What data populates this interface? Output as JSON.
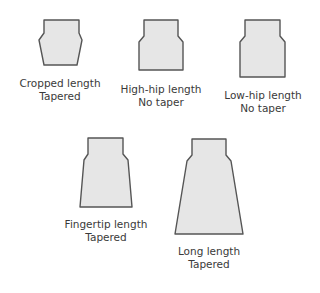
{
  "diagram": {
    "colors": {
      "fill": "#e6e6e6",
      "stroke": "#555555",
      "text": "#3a3a3a"
    },
    "shapes": [
      {
        "id": "cropped",
        "line1": "Cropped length",
        "line2": "Tapered",
        "points": "44,20 79,20 79,33 82,40 77,65 44,65 39,40 44,33"
      },
      {
        "id": "high-hip",
        "line1": "High-hip length",
        "line2": "No taper",
        "points": "144,20 178,20 178,36 183,42 183,70 139,70 139,42 144,36"
      },
      {
        "id": "low-hip",
        "line1": "Low-hip length",
        "line2": "No taper",
        "points": "245,20 280,20 280,36 285,42 285,77 240,77 240,42 245,36"
      },
      {
        "id": "fingertip",
        "line1": "Fingertip length",
        "line2": "Tapered",
        "points": "88,138 123,138 123,154 128,160 132,207 80,207 84,160 88,154"
      },
      {
        "id": "long",
        "line1": "Long length",
        "line2": "Tapered",
        "points": "192,139 226,139 226,155 231,161 243,234 175,234 187,161 192,155"
      }
    ]
  }
}
